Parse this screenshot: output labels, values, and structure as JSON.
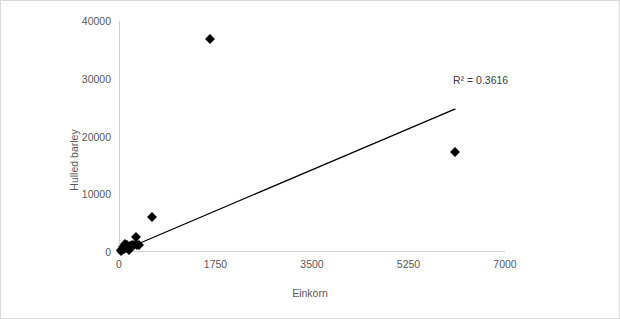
{
  "chart_data": {
    "type": "scatter",
    "title": "",
    "xlabel": "Einkorn",
    "ylabel": "Hulled barley",
    "xlim": [
      0,
      7000
    ],
    "ylim": [
      0,
      40000
    ],
    "xticks": [
      0,
      1750,
      3500,
      5250,
      7000
    ],
    "yticks": [
      0,
      10000,
      20000,
      30000,
      40000
    ],
    "xtick_labels": [
      "0",
      "1750",
      "3500",
      "5250",
      "7000"
    ],
    "ytick_labels": [
      "0",
      "10000",
      "20000",
      "30000",
      "40000"
    ],
    "grid": false,
    "legend": false,
    "marker": "diamond",
    "marker_color": "#000000",
    "axis_color": "#d0d0d0",
    "text_color": "#595959",
    "points": [
      {
        "x": 30,
        "y": 150
      },
      {
        "x": 45,
        "y": 400
      },
      {
        "x": 60,
        "y": 260
      },
      {
        "x": 75,
        "y": 900
      },
      {
        "x": 90,
        "y": 520
      },
      {
        "x": 110,
        "y": 1300
      },
      {
        "x": 130,
        "y": 700
      },
      {
        "x": 150,
        "y": 1150
      },
      {
        "x": 175,
        "y": 300
      },
      {
        "x": 200,
        "y": 1000
      },
      {
        "x": 230,
        "y": 1250
      },
      {
        "x": 270,
        "y": 1150
      },
      {
        "x": 300,
        "y": 2600
      },
      {
        "x": 330,
        "y": 1200
      },
      {
        "x": 360,
        "y": 1150
      },
      {
        "x": 590,
        "y": 6000
      },
      {
        "x": 1650,
        "y": 36800
      },
      {
        "x": 6100,
        "y": 17400
      }
    ],
    "trendline": {
      "label": "linear",
      "x_start": 0,
      "y_start": 0,
      "x_end": 6100,
      "y_end": 24800,
      "color": "#000000"
    },
    "annotations": [
      {
        "name": "r-squared",
        "text": "R² = 0.3616",
        "x": 6000,
        "y": 30500
      }
    ]
  },
  "annotation": {
    "r_squared_text": "R² = 0.3616"
  },
  "axes": {
    "x_title": "Einkorn",
    "y_title": "Hulled barley"
  }
}
